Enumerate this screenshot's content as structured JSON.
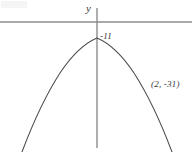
{
  "figure": {
    "kind": "coordinate-graph",
    "background_color": "#ffffff",
    "width": 192,
    "height": 152
  },
  "axes": {
    "y_axis_label": "y",
    "x_axis_label": "",
    "axis_color": "#8c8c8c",
    "x_axis_y_position": 22,
    "y_axis_x_position": 97,
    "y_axis_top": 8,
    "y_axis_bottom": 148
  },
  "curve": {
    "color": "#4a4a4a",
    "opens": "down",
    "vertex_x_px": 97,
    "vertex_y_px": 38,
    "path": "M 22 152 Q 40 104 60 73 Q 78 46 97 38 Q 116 46 134 73 Q 154 104 172 152"
  },
  "labels": {
    "vertex_value": "-11",
    "point_on_curve": "(2, -31)"
  },
  "chart_data": {
    "type": "line",
    "title": "",
    "xlabel": "",
    "ylabel": "y",
    "grid": false,
    "legend": null,
    "annotations": [
      {
        "name": "y-intercept-value",
        "text": "-11",
        "describes": "value marked at the vertex / y-intercept of the parabola"
      },
      {
        "name": "point-on-curve",
        "text": "(2, -31)",
        "x": 2,
        "y": -31,
        "describes": "labeled point on the right branch of the parabola"
      }
    ],
    "series": [
      {
        "name": "parabola",
        "shape": "downward-opening parabola",
        "vertex": [
          0,
          -11
        ],
        "points": [
          [
            0,
            -11
          ],
          [
            2,
            -31
          ]
        ]
      }
    ]
  }
}
